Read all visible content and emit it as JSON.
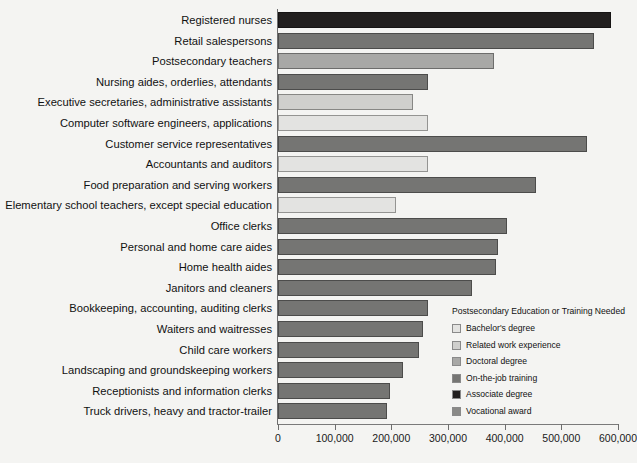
{
  "chart_data": {
    "type": "bar",
    "orientation": "horizontal",
    "title": "",
    "xlabel": "",
    "ylabel": "",
    "xlim": [
      0,
      600000
    ],
    "grid": false,
    "xticks": [
      0,
      100000,
      200000,
      300000,
      400000,
      500000,
      600000
    ],
    "xtick_labels": [
      "0",
      "100,000",
      "200,000",
      "300,000",
      "400,000",
      "500,000",
      "600,000"
    ],
    "categories": [
      "Registered nurses",
      "Retail salespersons",
      "Postsecondary teachers",
      "Nursing aides, orderlies, attendants",
      "Executive secretaries, administrative assistants",
      "Computer software engineers, applications",
      "Customer service representatives",
      "Accountants and auditors",
      "Food preparation and serving workers",
      "Elementary school teachers, except special education",
      "Office clerks",
      "Personal and home care aides",
      "Home health aides",
      "Janitors and cleaners",
      "Bookkeeping, accounting, auditing clerks",
      "Waiters and waitresses",
      "Child care workers",
      "Landscaping and groundskeeping workers",
      "Receptionists and information clerks",
      "Truck drivers, heavy and tractor-trailer"
    ],
    "values": [
      587000,
      557000,
      382000,
      264000,
      239000,
      264000,
      545000,
      264000,
      455000,
      209000,
      404000,
      389000,
      384000,
      342000,
      264000,
      255000,
      248000,
      221000,
      198000,
      193000
    ],
    "groups": [
      "Associate degree",
      "On-the-job training",
      "Doctoral degree",
      "On-the-job training",
      "Related work experience",
      "Bachelor's degree",
      "On-the-job training",
      "Bachelor's degree",
      "On-the-job training",
      "Bachelor's degree",
      "On-the-job training",
      "On-the-job training",
      "On-the-job training",
      "On-the-job training",
      "On-the-job training",
      "On-the-job training",
      "On-the-job training",
      "On-the-job training",
      "On-the-job training",
      "On-the-job training"
    ],
    "legend": {
      "title": "Postsecondary Education or Training Needed",
      "position": "inside-lower-right",
      "entries": [
        {
          "label": "Bachelor's degree",
          "color": "#e3e3e1"
        },
        {
          "label": "Related work experience",
          "color": "#cfcfcd"
        },
        {
          "label": "Doctoral degree",
          "color": "#a8a8a6"
        },
        {
          "label": "On-the-job training",
          "color": "#757573"
        },
        {
          "label": "Associate degree",
          "color": "#221f1f"
        },
        {
          "label": "Vocational award",
          "color": "#8a8a88"
        }
      ]
    },
    "colors": {
      "background": "#f4f4f2",
      "axis": "#6e6e6e",
      "text": "#111111"
    }
  }
}
